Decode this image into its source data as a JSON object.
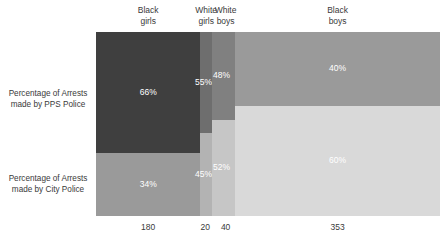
{
  "chart_data": {
    "type": "bar",
    "subtype": "mosaic-marimekko-100pct-stacked",
    "title": "",
    "xlabel": "",
    "ylabel": "",
    "categories": [
      "Black girls",
      "White girls",
      "White boys",
      "Black boys"
    ],
    "category_labels_multiline": [
      "Black\ngirls",
      "White\ngirls",
      "White\nboys",
      "Black\nboys"
    ],
    "category_totals": [
      180,
      20,
      40,
      353
    ],
    "category_total_labels": [
      "180",
      "20",
      "40",
      "353"
    ],
    "series": [
      {
        "name": "Percentage of Arrests made by PPS Police",
        "values": [
          66,
          55,
          48,
          40
        ],
        "value_labels": [
          "66%",
          "55%",
          "48%",
          "40%"
        ],
        "colors": [
          "#3f3f3f",
          "#6e6e6e",
          "#808080",
          "#9a9a9a"
        ]
      },
      {
        "name": "Percentage of Arrests made by City Police",
        "values": [
          34,
          45,
          52,
          60
        ],
        "value_labels": [
          "34%",
          "45%",
          "52%",
          "60%"
        ],
        "colors": [
          "#9a9a9a",
          "#b3b3b3",
          "#c6c6c6",
          "#d9d9d9"
        ]
      }
    ],
    "ylim": [
      0,
      100
    ],
    "grid": false,
    "legend": "none"
  },
  "header": {
    "columns": [
      {
        "id": "black-girls",
        "label": "Black\ngirls"
      },
      {
        "id": "white-girls",
        "label": "White\ngirls"
      },
      {
        "id": "white-boys",
        "label": "White\nboys"
      },
      {
        "id": "black-boys",
        "label": "Black\nboys"
      }
    ]
  },
  "rows": [
    {
      "id": "pps-police",
      "label": "Percentage of Arrests\nmade by PPS Police"
    },
    {
      "id": "city-police",
      "label": "Percentage of Arrests\nmade by City Police"
    }
  ],
  "axis": {
    "totals": [
      {
        "id": "total-black-girls",
        "label": "180"
      },
      {
        "id": "total-white-girls",
        "label": "20"
      },
      {
        "id": "total-white-boys",
        "label": "40"
      },
      {
        "id": "total-black-boys",
        "label": "353"
      }
    ]
  },
  "cells": {
    "top": [
      {
        "id": "pps-black-girls",
        "label": "66%"
      },
      {
        "id": "pps-white-girls",
        "label": "55%"
      },
      {
        "id": "pps-white-boys",
        "label": "48%"
      },
      {
        "id": "pps-black-boys",
        "label": "40%"
      }
    ],
    "bottom": [
      {
        "id": "city-black-girls",
        "label": "34%"
      },
      {
        "id": "city-white-girls",
        "label": "45%"
      },
      {
        "id": "city-white-boys",
        "label": "52%"
      },
      {
        "id": "city-black-boys",
        "label": "60%"
      }
    ]
  },
  "colors": {
    "background": "#ffffff",
    "text": "#3a3a3a",
    "value_text": "#ffffff"
  }
}
